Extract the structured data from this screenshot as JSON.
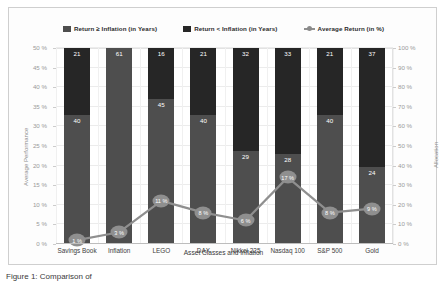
{
  "chart_data": {
    "type": "bar",
    "subtype": "stacked-column-with-line-overlay",
    "title": "",
    "xlabel": "Asset Classes and Inflation",
    "ylabel": "Average Performance",
    "y2label": "Allocation",
    "ylim": [
      0,
      50
    ],
    "y2lim": [
      0,
      100
    ],
    "grid": true,
    "legend_position": "top-center",
    "categories": [
      "Savings Book",
      "Inflation",
      "LEGO",
      "DAX",
      "Nikkei 225",
      "Nasdaq 100",
      "S&P 500",
      "Gold"
    ],
    "ytick_labels": [
      "0 %",
      "5 %",
      "10 %",
      "15 %",
      "20 %",
      "25 %",
      "30 %",
      "35 %",
      "40 %",
      "45 %",
      "50 %"
    ],
    "ytick_values": [
      0,
      5,
      10,
      15,
      20,
      25,
      30,
      35,
      40,
      45,
      50
    ],
    "y2tick_labels": [
      "0 %",
      "10 %",
      "20 %",
      "30 %",
      "40 %",
      "50 %",
      "60 %",
      "70 %",
      "80 %",
      "90 %",
      "100 %"
    ],
    "y2tick_values": [
      0,
      10,
      20,
      30,
      40,
      50,
      60,
      70,
      80,
      90,
      100
    ],
    "series": [
      {
        "name": "Return ≥ Inflation (in Years)",
        "type": "bar",
        "stack": "years",
        "axis": "right",
        "color": "#4e4e4e",
        "values": [
          40,
          61,
          45,
          40,
          29,
          28,
          40,
          24
        ]
      },
      {
        "name": "Return < Inflation (in Years)",
        "type": "bar",
        "stack": "years",
        "axis": "right",
        "color": "#262626",
        "values": [
          21,
          0,
          16,
          21,
          32,
          33,
          21,
          37
        ]
      },
      {
        "name": "Average Return (in %)",
        "type": "line",
        "axis": "left",
        "color": "#8f8f8f",
        "values": [
          1,
          3,
          11,
          8,
          6,
          17,
          8,
          9
        ],
        "point_labels": [
          "1 %",
          "3 %",
          "11 %",
          "8 %",
          "6 %",
          "17 %",
          "8 %",
          "9 %"
        ]
      }
    ],
    "bar_totals": [
      61,
      61,
      61,
      61,
      61,
      61,
      61,
      61
    ]
  },
  "legend": {
    "items": [
      {
        "label": "Return ≥ Inflation (in Years)",
        "marker": "square",
        "color": "#4e4e4e"
      },
      {
        "label": "Return < Inflation (in Years)",
        "marker": "square",
        "color": "#262626"
      },
      {
        "label": "Average Return (in %)",
        "marker": "line-with-dot",
        "color": "#8f8f8f"
      }
    ]
  },
  "axes": {
    "left_title": "Average Performance",
    "right_title": "Allocation",
    "x_title": "Asset Classes and Inflation"
  },
  "caption": {
    "text": "Figure 1: Comparison of"
  }
}
